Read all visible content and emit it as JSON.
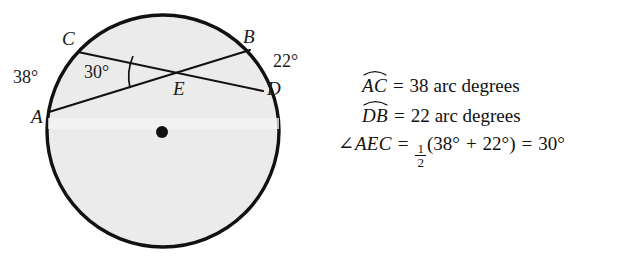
{
  "figure": {
    "name": "circle-with-intersecting-chords",
    "circle": {
      "cx": 163,
      "cy": 131,
      "r": 116,
      "fill_color": "#ebebeb",
      "stroke_color": "#111111",
      "stroke_width": 3.4
    },
    "center_dot": {
      "cx": 162,
      "cy": 132,
      "r": 6,
      "color": "#111111"
    },
    "chords": [
      {
        "name": "chord-AB",
        "from": "A",
        "to": "B",
        "x1": 49,
        "y1": 112,
        "x2": 250,
        "y2": 50
      },
      {
        "name": "chord-CD",
        "from": "C",
        "to": "D",
        "x1": 78,
        "y1": 52,
        "x2": 263,
        "y2": 91
      }
    ],
    "intersection": {
      "point": "E",
      "x": 180,
      "y": 73
    },
    "angle_arc": {
      "label": "30°",
      "at": "E",
      "sweep_from": "EA",
      "sweep_to": "EC"
    },
    "point_labels": [
      {
        "id": "lbl-A",
        "text": "A"
      },
      {
        "id": "lbl-B",
        "text": "B"
      },
      {
        "id": "lbl-C",
        "text": "C"
      },
      {
        "id": "lbl-D",
        "text": "D"
      },
      {
        "id": "lbl-E",
        "text": "E"
      }
    ],
    "measure_labels": [
      {
        "id": "lbl-38",
        "text": "38°",
        "describes": "arc AC"
      },
      {
        "id": "lbl-30",
        "text": "30°",
        "describes": "angle AEC"
      },
      {
        "id": "lbl-22",
        "text": "22°",
        "describes": "arc DB"
      }
    ]
  },
  "equations": {
    "line1": {
      "arc_term": "AC",
      "equals": "=",
      "value": "38",
      "units": "arc degrees"
    },
    "line2": {
      "arc_term": "DB",
      "equals": "=",
      "value": "22",
      "units": "arc degrees"
    },
    "line3": {
      "angle_symbol": "∠",
      "angle_name": "AEC",
      "equals1": "=",
      "fraction_numerator": "1",
      "fraction_denominator": "2",
      "open_paren": "(",
      "term1": "38°",
      "plus": "+",
      "term2": "22°",
      "close_paren": ")",
      "equals2": "=",
      "result": "30°"
    }
  }
}
